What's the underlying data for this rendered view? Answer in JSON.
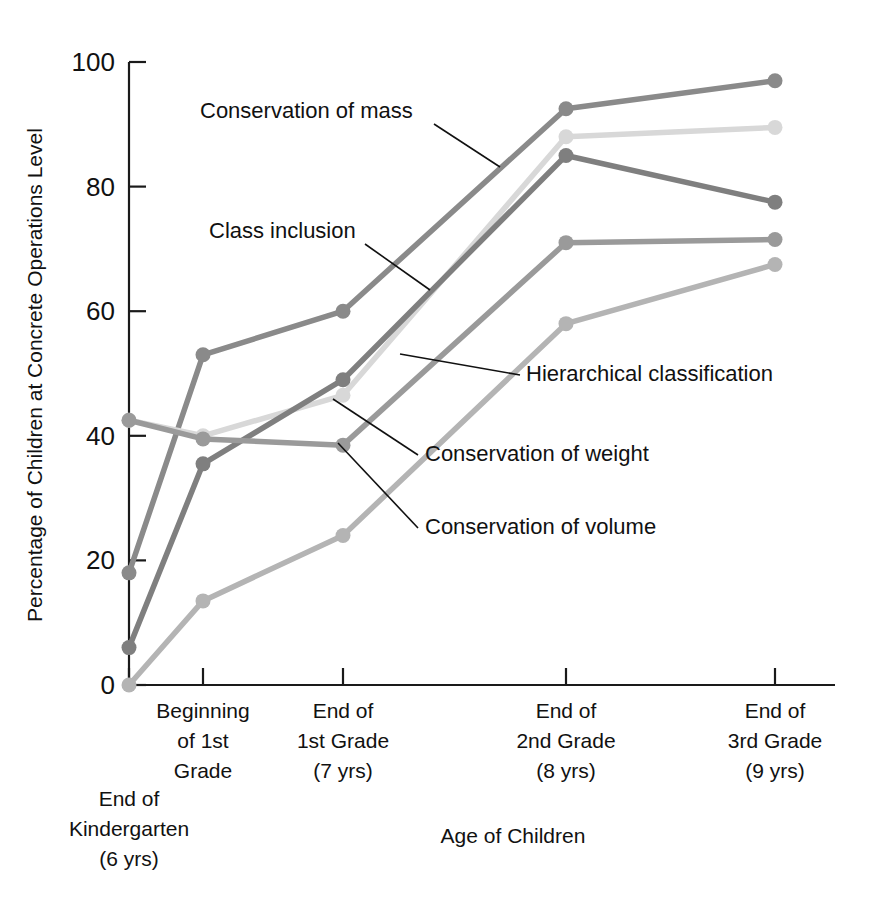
{
  "chart_data": {
    "type": "line",
    "title": "",
    "xlabel": "Age of Children",
    "ylabel": "Percentage of Children at Concrete Operations Level",
    "ylim": [
      0,
      100
    ],
    "yticks": [
      0,
      20,
      40,
      60,
      80,
      100
    ],
    "ytick_labels": [
      "0",
      "20",
      "40",
      "60",
      "80",
      "100"
    ],
    "grid": false,
    "legend": "inline-annotations",
    "categories": [
      "End of\nKindergarten\n(6 yrs)",
      "Beginning\nof 1st\nGrade",
      "End of\n1st Grade\n(7 yrs)",
      "End of\n2nd Grade\n(8 yrs)",
      "End of\n3rd Grade\n(9 yrs)"
    ],
    "category_lines": [
      [
        "End of",
        "Kindergarten",
        "(6 yrs)"
      ],
      [
        "Beginning",
        "of 1st",
        "Grade"
      ],
      [
        "End of",
        "1st Grade",
        "(7 yrs)"
      ],
      [
        "End of",
        "2nd Grade",
        "(8 yrs)"
      ],
      [
        "End of",
        "3rd Grade",
        "(9 yrs)"
      ]
    ],
    "series": [
      {
        "name": "Conservation of mass",
        "color": "#8a8a8a",
        "values": [
          18,
          53,
          60,
          92.5,
          97
        ]
      },
      {
        "name": "Class inclusion",
        "color": "#d8d8d8",
        "values": [
          42.5,
          40,
          46.5,
          88,
          89.5
        ]
      },
      {
        "name": "Hierarchical classification",
        "color": "#7f7f7f",
        "values": [
          6,
          35.5,
          49,
          85,
          77.5
        ]
      },
      {
        "name": "Conservation of weight",
        "color": "#9a9a9a",
        "values": [
          42.5,
          39.5,
          38.5,
          71,
          71.5
        ]
      },
      {
        "name": "Conservation of volume",
        "color": "#b4b4b4",
        "values": [
          0,
          13.5,
          24,
          58,
          67.5
        ]
      }
    ],
    "annotations": [
      {
        "label": "Conservation of mass",
        "text_x": 200,
        "text_y": 118,
        "leader": "M 434 124 L 500 167"
      },
      {
        "label": "Class inclusion",
        "text_x": 209,
        "text_y": 238,
        "leader": "M 365 244 L 430 290"
      },
      {
        "label": "Hierarchical classification",
        "text_x": 526,
        "text_y": 381,
        "leader": "M 520 375 L 400 354"
      },
      {
        "label": "Conservation of weight",
        "text_x": 425,
        "text_y": 461,
        "leader": "M 418 455 L 333 399"
      },
      {
        "label": "Conservation of volume",
        "text_x": 425,
        "text_y": 534,
        "leader": "M 418 528 L 338 443"
      }
    ]
  }
}
